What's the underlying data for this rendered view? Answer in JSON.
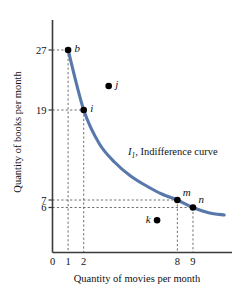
{
  "chart_data": {
    "type": "line",
    "title": "",
    "xlabel": "Quantity of movies per month",
    "ylabel": "Quantity of books per month",
    "xlim": [
      0,
      11.5
    ],
    "ylim": [
      0,
      31
    ],
    "grid": false,
    "legend_position": "inline-annotation",
    "curve_label": "I",
    "curve_label_sub": "1",
    "curve_label_rest": ", Indifference curve",
    "curve_color": "#5878ac",
    "x_ticks": [
      "0",
      "1",
      "2",
      "8",
      "9"
    ],
    "x_tick_values": [
      0,
      1,
      2,
      8,
      9
    ],
    "y_ticks": [
      "27",
      "19",
      "7",
      "6"
    ],
    "y_tick_values": [
      27,
      19,
      7,
      6
    ],
    "series": [
      {
        "name": "I1, Indifference curve",
        "points": [
          {
            "x": 1,
            "y": 27
          },
          {
            "x": 2,
            "y": 19
          },
          {
            "x": 3,
            "y": 14.5
          },
          {
            "x": 4,
            "y": 12
          },
          {
            "x": 5,
            "y": 10.2
          },
          {
            "x": 6,
            "y": 8.9
          },
          {
            "x": 7,
            "y": 7.8
          },
          {
            "x": 8,
            "y": 7
          },
          {
            "x": 9,
            "y": 6
          },
          {
            "x": 10,
            "y": 5.3
          },
          {
            "x": 11,
            "y": 5.0
          }
        ]
      }
    ],
    "annotated_points": [
      {
        "label": "b",
        "x": 1,
        "y": 27,
        "on_curve": true,
        "label_pos": "right"
      },
      {
        "label": "i",
        "x": 2,
        "y": 19,
        "on_curve": true,
        "label_pos": "right"
      },
      {
        "label": "j",
        "x": 3.6,
        "y": 22.2,
        "on_curve": false,
        "label_pos": "right"
      },
      {
        "label": "m",
        "x": 8,
        "y": 7,
        "on_curve": true,
        "label_pos": "upper-right"
      },
      {
        "label": "n",
        "x": 9,
        "y": 6,
        "on_curve": true,
        "label_pos": "upper-right"
      },
      {
        "label": "k",
        "x": 6.7,
        "y": 4.3,
        "on_curve": false,
        "label_pos": "left"
      }
    ],
    "guide_lines": [
      {
        "point": "b",
        "x": 1,
        "y": 27
      },
      {
        "point": "i",
        "x": 2,
        "y": 19
      },
      {
        "point": "m",
        "x": 8,
        "y": 7
      },
      {
        "point": "n",
        "x": 9,
        "y": 6
      }
    ]
  }
}
